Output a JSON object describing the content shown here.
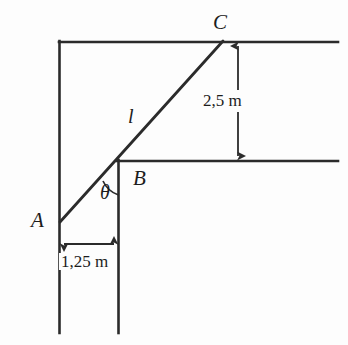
{
  "figure": {
    "type": "geometry-diagram",
    "background_color": "#fdfdfd",
    "stroke_color": "#2b2b2b",
    "points": {
      "a": {
        "label": "A",
        "x": 60,
        "y": 222
      },
      "b": {
        "label": "B",
        "x": 118,
        "y": 163
      },
      "c": {
        "label": "C",
        "x": 222,
        "y": 42
      }
    },
    "segments": {
      "diagonal": {
        "label": "l",
        "from": "a",
        "to": "c"
      }
    },
    "angle": {
      "label": "θ",
      "vertex": "b"
    },
    "dimensions": {
      "vertical": {
        "label": "2,5 m",
        "value": 2.5,
        "unit": "m"
      },
      "horizontal": {
        "label": "1,25 m",
        "value": 1.25,
        "unit": "m"
      }
    },
    "lines": {
      "top_horizontal": {
        "y": 42,
        "x1": 59,
        "x2": 338
      },
      "middle_horizontal": {
        "y": 161,
        "x1": 118,
        "x2": 338
      },
      "left_vertical": {
        "x": 59,
        "y1": 42,
        "y2": 333
      },
      "right_vertical": {
        "x": 118,
        "y1": 161,
        "y2": 333
      }
    }
  }
}
